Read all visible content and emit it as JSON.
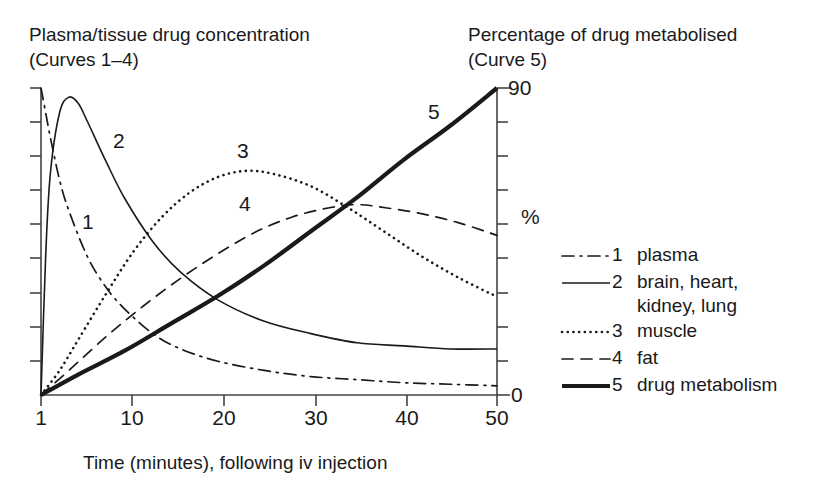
{
  "left_axis_title": "Plasma/tissue drug concentration\n(Curves 1–4)",
  "right_axis_title": "Percentage of drug metabolised\n(Curve 5)",
  "x_axis_caption": "Time (minutes), following iv injection",
  "right_axis_unit": "%",
  "right_axis_top_label": "90",
  "right_axis_bottom_label": "0",
  "x_tick_labels": [
    "1",
    "10",
    "20",
    "30",
    "40",
    "50"
  ],
  "curve_labels": {
    "c1": "1",
    "c2": "2",
    "c3": "3",
    "c4": "4",
    "c5": "5"
  },
  "legend": {
    "items": [
      {
        "num": "1",
        "label": "plasma",
        "style": "dash-dot"
      },
      {
        "num": "2",
        "label": "brain, heart,\nkidney, lung",
        "style": "solid"
      },
      {
        "num": "3",
        "label": "muscle",
        "style": "dotted"
      },
      {
        "num": "4",
        "label": "fat",
        "style": "dashed"
      },
      {
        "num": "5",
        "label": "drug metabolism",
        "style": "thick-solid"
      }
    ]
  },
  "colors": {
    "ink": "#1a1a1a",
    "axis": "#444444",
    "background": "#ffffff"
  },
  "chart_data": {
    "type": "line",
    "title": "",
    "xlabel": "Time (minutes), following iv injection",
    "ylabel_left": "Plasma/tissue drug concentration (Curves 1–4)",
    "ylabel_right": "Percentage of drug metabolised (Curve 5)",
    "xlim": [
      1,
      50
    ],
    "ylim_left": [
      0,
      100
    ],
    "ylim_right": [
      0,
      90
    ],
    "grid": false,
    "legend_position": "right",
    "x_ticks": [
      1,
      10,
      20,
      30,
      40,
      50
    ],
    "right_y_ticks": [
      0,
      10,
      20,
      30,
      40,
      50,
      60,
      70,
      80,
      90
    ],
    "series": [
      {
        "name": "1 plasma",
        "style": "dash-dot",
        "axis": "left",
        "x": [
          1,
          1.5,
          2,
          3,
          4,
          6,
          8,
          10,
          13,
          16,
          20,
          25,
          30,
          35,
          40,
          45,
          50
        ],
        "y": [
          100,
          92,
          84,
          70,
          60,
          45,
          35,
          28,
          20,
          15,
          11,
          8,
          6,
          5,
          4,
          3.5,
          3
        ]
      },
      {
        "name": "2 brain, heart, kidney, lung",
        "style": "solid",
        "axis": "left",
        "x": [
          1,
          1.5,
          2,
          3,
          4,
          5,
          6,
          8,
          10,
          13,
          16,
          20,
          25,
          30,
          35,
          40,
          45,
          50
        ],
        "y": [
          0,
          45,
          72,
          92,
          97,
          95,
          89,
          76,
          64,
          50,
          40,
          31,
          24,
          20,
          17,
          16,
          15,
          15
        ]
      },
      {
        "name": "3 muscle",
        "style": "dotted",
        "axis": "left",
        "x": [
          1,
          3,
          5,
          8,
          11,
          14,
          17,
          20,
          23,
          26,
          30,
          34,
          38,
          42,
          46,
          50
        ],
        "y": [
          0,
          8,
          18,
          33,
          47,
          58,
          66,
          71,
          73,
          72,
          68,
          61,
          53,
          45,
          38,
          32
        ]
      },
      {
        "name": "4 fat",
        "style": "dashed",
        "axis": "left",
        "x": [
          1,
          4,
          8,
          12,
          16,
          20,
          24,
          28,
          32,
          35,
          38,
          42,
          46,
          50
        ],
        "y": [
          0,
          8,
          19,
          29,
          38,
          46,
          53,
          58,
          61,
          62,
          61,
          59,
          56,
          52
        ]
      },
      {
        "name": "5 drug metabolism",
        "style": "thick-solid",
        "axis": "right",
        "x": [
          1,
          5,
          10,
          15,
          20,
          25,
          30,
          35,
          40,
          45,
          50
        ],
        "y": [
          0,
          6,
          13,
          21,
          29,
          38,
          48,
          58,
          69,
          79,
          90
        ]
      }
    ]
  }
}
